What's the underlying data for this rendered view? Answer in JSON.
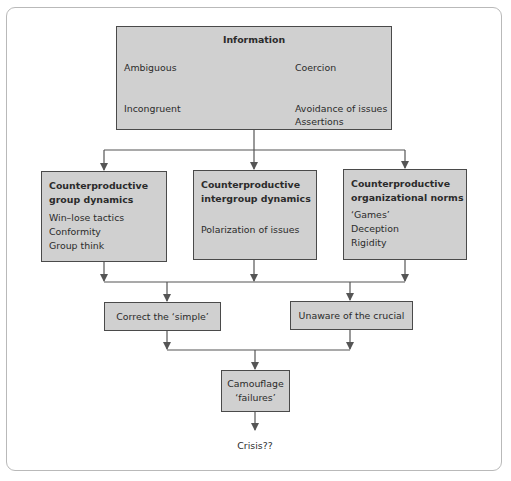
{
  "diagram": {
    "info_box": {
      "title": "Information",
      "left_top": "Ambiguous",
      "right_top": "Coercion",
      "left_bottom": "Incongruent",
      "right_bottom": [
        "Avoidance of issues",
        "Assertions"
      ]
    },
    "groups": [
      {
        "title": "Counterproductive group dynamics",
        "title_lines": [
          "Counterproductive",
          "group dynamics"
        ],
        "items": [
          "Win–lose tactics",
          "Conformity",
          "Group think"
        ]
      },
      {
        "title": "Counterproductive intergroup dynamics",
        "title_lines": [
          "Counterproductive",
          "intergroup dynamics"
        ],
        "items": [
          "Polarization of issues"
        ]
      },
      {
        "title": "Counterproductive organizational norms",
        "title_lines": [
          "Counterproductive",
          "organizational norms"
        ],
        "items": [
          "‘Games’",
          "Deception",
          "Rigidity"
        ]
      }
    ],
    "outcomes": [
      {
        "label": "Correct the  ‘simple’"
      },
      {
        "label": "Unaware of the crucial"
      }
    ],
    "camouflage": {
      "lines": [
        "Camouflage",
        "‘failures’"
      ]
    },
    "result": "Crisis??",
    "colors": {
      "box_fill": "#d0d0d0",
      "box_border": "#4a4a4a",
      "connector": "#555555",
      "frame": "#b9b9b9"
    }
  }
}
